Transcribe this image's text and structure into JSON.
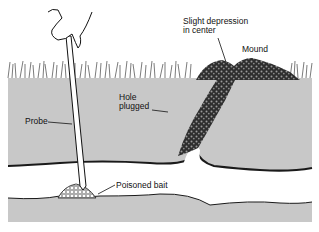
{
  "diagram": {
    "labels": {
      "depression_line1": "Slight depression",
      "depression_line2": "in center",
      "mound": "Mound",
      "hole_line1": "Hole",
      "hole_line2": "plugged",
      "probe": "Probe",
      "bait": "Poisoned bait"
    },
    "colors": {
      "soil": "#c8c8c8",
      "tunnel": "#ffffff",
      "outline": "#1a1a1a",
      "plug": "#3a3a3a",
      "probe": "#ffffff"
    }
  }
}
